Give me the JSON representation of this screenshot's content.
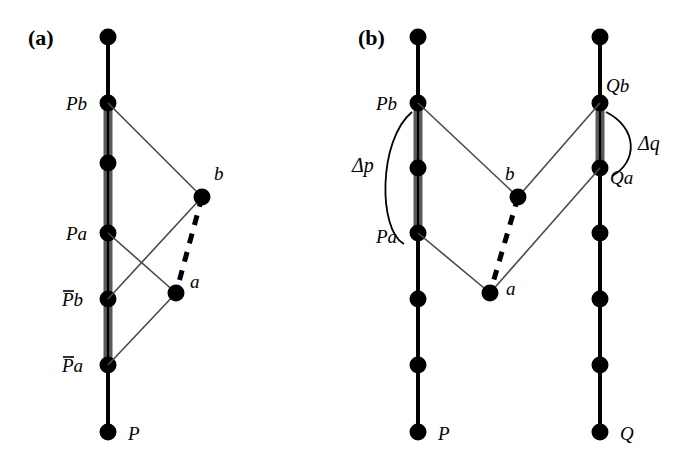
{
  "figure": {
    "width": 697,
    "height": 463,
    "background": "#ffffff",
    "ink_color": "#000000",
    "highlight_color": "#5a5a5a",
    "thin_line_color": "#4a4a4a"
  },
  "panels": [
    {
      "id": "a",
      "label": "(a)",
      "label_x": 28,
      "label_y": 45,
      "worldlines": [
        {
          "name": "P",
          "x": 108,
          "bottom_label": "P",
          "bottom_label_x": 128,
          "bottom_label_y": 440,
          "nodes": [
            {
              "y": 37,
              "label": "",
              "label_x": 0,
              "label_y": 0,
              "overbar": false
            },
            {
              "y": 103,
              "label": "Pb",
              "label_x": 66,
              "label_y": 110,
              "overbar": false
            },
            {
              "y": 163,
              "label": "",
              "label_x": 0,
              "label_y": 0,
              "overbar": false
            },
            {
              "y": 233,
              "label": "Pa",
              "label_x": 66,
              "label_y": 240,
              "overbar": false
            },
            {
              "y": 299,
              "label": "Pb",
              "label_x": 62,
              "label_y": 306,
              "overbar": true
            },
            {
              "y": 365,
              "label": "Pa",
              "label_x": 62,
              "label_y": 372,
              "overbar": true
            },
            {
              "y": 432,
              "label": "",
              "label_x": 0,
              "label_y": 0,
              "overbar": false
            }
          ],
          "highlight_from_y": 103,
          "highlight_to_y": 365
        }
      ],
      "events": [
        {
          "name": "b",
          "x": 202,
          "y": 197,
          "label": "b",
          "label_x": 214,
          "label_y": 180
        },
        {
          "name": "a",
          "x": 176,
          "y": 293,
          "label": "a",
          "label_x": 190,
          "label_y": 288
        }
      ],
      "light_rays": [
        {
          "from": "Pb_node",
          "x1": 108,
          "y1": 103,
          "x2": 202,
          "y2": 197
        },
        {
          "from": "Pa_node",
          "x1": 108,
          "y1": 233,
          "x2": 176,
          "y2": 293
        },
        {
          "from": "Pbar_b_node",
          "x1": 108,
          "y1": 299,
          "x2": 202,
          "y2": 197
        },
        {
          "from": "Pbar_a_node",
          "x1": 108,
          "y1": 365,
          "x2": 176,
          "y2": 293
        }
      ],
      "dashed_separation": {
        "x1": 202,
        "y1": 197,
        "x2": 176,
        "y2": 293
      },
      "arcs": []
    },
    {
      "id": "b",
      "label": "(b)",
      "label_x": 358,
      "label_y": 45,
      "worldlines": [
        {
          "name": "P",
          "x": 418,
          "bottom_label": "P",
          "bottom_label_x": 438,
          "bottom_label_y": 440,
          "nodes": [
            {
              "y": 37,
              "label": "",
              "label_x": 0,
              "label_y": 0,
              "overbar": false
            },
            {
              "y": 103,
              "label": "Pb",
              "label_x": 376,
              "label_y": 110,
              "overbar": false
            },
            {
              "y": 168,
              "label": "",
              "label_x": 0,
              "label_y": 0,
              "overbar": false
            },
            {
              "y": 233,
              "label": "Pa",
              "label_x": 376,
              "label_y": 243,
              "overbar": false
            },
            {
              "y": 299,
              "label": "",
              "label_x": 0,
              "label_y": 0,
              "overbar": false
            },
            {
              "y": 365,
              "label": "",
              "label_x": 0,
              "label_y": 0,
              "overbar": false
            },
            {
              "y": 432,
              "label": "",
              "label_x": 0,
              "label_y": 0,
              "overbar": false
            }
          ],
          "highlight_from_y": 103,
          "highlight_to_y": 233
        },
        {
          "name": "Q",
          "x": 600,
          "bottom_label": "Q",
          "bottom_label_x": 620,
          "bottom_label_y": 440,
          "nodes": [
            {
              "y": 37,
              "label": "",
              "label_x": 0,
              "label_y": 0,
              "overbar": false
            },
            {
              "y": 103,
              "label": "Qb",
              "label_x": 606,
              "label_y": 92,
              "overbar": false
            },
            {
              "y": 168,
              "label": "Qa",
              "label_x": 610,
              "label_y": 184,
              "overbar": false
            },
            {
              "y": 233,
              "label": "",
              "label_x": 0,
              "label_y": 0,
              "overbar": false
            },
            {
              "y": 299,
              "label": "",
              "label_x": 0,
              "label_y": 0,
              "overbar": false
            },
            {
              "y": 365,
              "label": "",
              "label_x": 0,
              "label_y": 0,
              "overbar": false
            },
            {
              "y": 432,
              "label": "",
              "label_x": 0,
              "label_y": 0,
              "overbar": false
            }
          ],
          "highlight_from_y": 103,
          "highlight_to_y": 168
        }
      ],
      "events": [
        {
          "name": "b",
          "x": 518,
          "y": 197,
          "label": "b",
          "label_x": 505,
          "label_y": 180
        },
        {
          "name": "a",
          "x": 490,
          "y": 293,
          "label": "a",
          "label_x": 506,
          "label_y": 295
        }
      ],
      "light_rays": [
        {
          "from": "Pb_node",
          "x1": 418,
          "y1": 103,
          "x2": 518,
          "y2": 197
        },
        {
          "from": "Pa_node",
          "x1": 418,
          "y1": 233,
          "x2": 490,
          "y2": 293
        },
        {
          "from": "Qb_node",
          "x1": 600,
          "y1": 103,
          "x2": 518,
          "y2": 197
        },
        {
          "from": "Qa_node",
          "x1": 600,
          "y1": 168,
          "x2": 490,
          "y2": 293
        }
      ],
      "dashed_separation": {
        "x1": 518,
        "y1": 197,
        "x2": 490,
        "y2": 293
      },
      "arcs": [
        {
          "name": "delta-p",
          "label": "Δp",
          "label_x": 352,
          "label_y": 172,
          "path": "M 412 112 C 378 140, 378 230, 404 244"
        },
        {
          "name": "delta-q",
          "label": "Δq",
          "label_x": 638,
          "label_y": 150,
          "path": "M 606 112 C 638 128, 638 162, 612 176"
        }
      ]
    }
  ],
  "geometry": {
    "node_radius": 8.5,
    "worldline_width": 4,
    "highlight_width": 9,
    "ray_width": 1.6,
    "dash_width": 5,
    "dash_pattern": "10 9",
    "arc_width": 1.8
  }
}
